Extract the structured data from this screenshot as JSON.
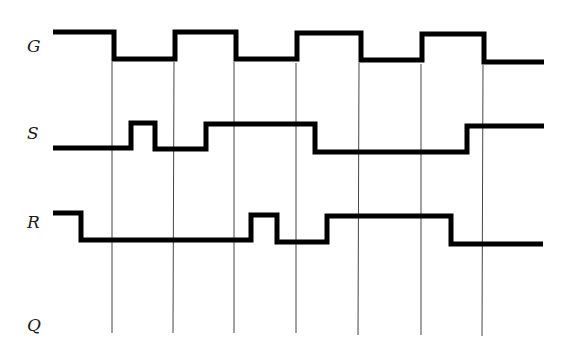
{
  "diagram": {
    "signals": [
      {
        "name": "G",
        "label_y": 52
      },
      {
        "name": "S",
        "label_y": 139
      },
      {
        "name": "R",
        "label_y": 228
      },
      {
        "name": "Q",
        "label_y": 331
      }
    ],
    "clock_lines_x": [
      112,
      174,
      234,
      296,
      358,
      421,
      483
    ],
    "clock_lines_y": [
      62,
      333
    ],
    "colors": {
      "wave": "#000000",
      "grid": "#444444",
      "background": "#ffffff"
    }
  }
}
